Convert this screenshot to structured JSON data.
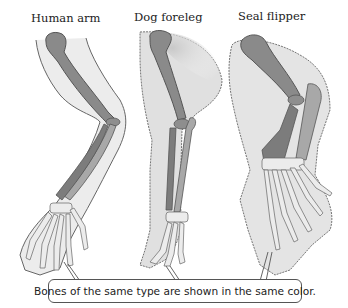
{
  "figure": {
    "limbs": [
      {
        "id": "human",
        "label": "Human arm"
      },
      {
        "id": "dog",
        "label": "Dog foreleg"
      },
      {
        "id": "seal",
        "label": "Seal flipper"
      }
    ],
    "caption": "Bones of the same type are shown in the same color.",
    "colors": {
      "humerus": "#8a8a8a",
      "radius": "#a6a6a6",
      "ulna": "#7c7c7c",
      "hand_bones": "#e6e6e6",
      "skin": "#e4e4e4",
      "outline": "#555555",
      "shadow": "#d0d0d0"
    }
  }
}
